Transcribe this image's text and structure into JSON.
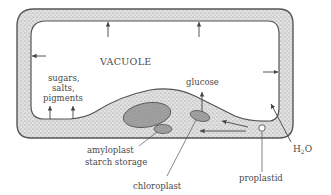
{
  "diagram": {
    "type": "plant-cell-plastid-diagram",
    "labels": {
      "vacuole": "VACUOLE",
      "sugars": "sugars,",
      "salts": "salts,",
      "pigments": "pigments",
      "glucose": "glucose",
      "amyloplast": "amyloplast",
      "starch_storage": "starch storage",
      "chloroplast": "chloroplast",
      "proplastid": "proplastid",
      "water_main": "H",
      "water_sub": "2",
      "water_end": "O"
    },
    "colors": {
      "wall_fill": "#d4d4d4",
      "wall_stroke": "#555555",
      "organelle_fill": "#9a9a9a",
      "text": "#4a4a4a",
      "arrow": "#444444"
    }
  }
}
